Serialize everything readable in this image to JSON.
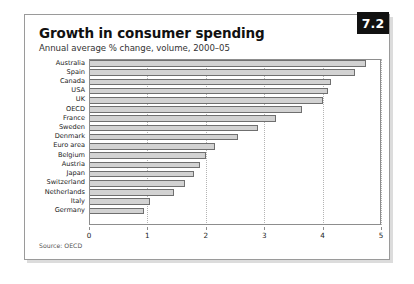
{
  "card": {
    "badge": "7.2",
    "title": "Growth in consumer spending",
    "subtitle": "Annual average % change, volume, 2000–05",
    "source": "Source: OECD"
  },
  "chart_data": {
    "type": "bar",
    "orientation": "horizontal",
    "title": "Growth in consumer spending",
    "subtitle": "Annual average % change, volume, 2000–05",
    "xlabel": "",
    "ylabel": "",
    "xlim": [
      0,
      5
    ],
    "xticks": [
      0,
      1,
      2,
      3,
      4,
      5
    ],
    "grid": "vertical-dotted",
    "legend": "none",
    "source": "Source: OECD",
    "categories": [
      "Australia",
      "Spain",
      "Canada",
      "USA",
      "UK",
      "OECD",
      "France",
      "Sweden",
      "Denmark",
      "Euro area",
      "Belgium",
      "Austria",
      "Japan",
      "Switzerland",
      "Netherlands",
      "Italy",
      "Germany"
    ],
    "values": [
      4.75,
      4.55,
      4.15,
      4.1,
      4.0,
      3.65,
      3.2,
      2.9,
      2.55,
      2.15,
      2.0,
      1.9,
      1.8,
      1.65,
      1.45,
      1.05,
      0.95
    ]
  }
}
